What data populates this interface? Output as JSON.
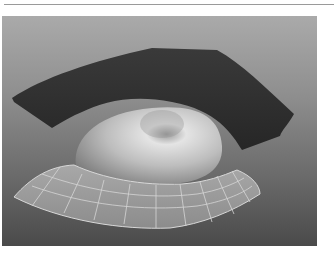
{
  "viewport": {
    "label": "3D perspective viewport",
    "model": "eye",
    "objects": [
      {
        "name": "upper-eyelid",
        "display": "smooth shaded",
        "color": "#2e2e2e"
      },
      {
        "name": "eyeball",
        "display": "smooth shaded",
        "color": "#c8c8c8"
      },
      {
        "name": "lower-eyelid",
        "display": "wireframe on shaded",
        "color": "#9c9c9c",
        "wire_color": "#d8d8d8"
      }
    ],
    "background": {
      "top": "#aaaaaa",
      "bottom": "#4a4a4a"
    }
  }
}
